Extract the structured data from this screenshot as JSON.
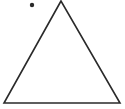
{
  "diagram": {
    "width": 125,
    "height": 109,
    "background": "#ffffff",
    "stroke_color": "#2a2a2a",
    "triangle": {
      "points": "61,1 4,103 120,103",
      "stroke_width": 1.6
    },
    "dot": {
      "cx": 32,
      "cy": 5,
      "r": 2.2
    }
  }
}
